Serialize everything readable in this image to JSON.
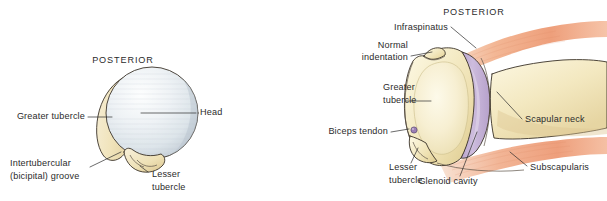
{
  "figure": {
    "background_color": "#ffffff",
    "text_color": "#2b2b2b",
    "panels": [
      {
        "id": "left-panel",
        "name": "humeral-head-posterior-view",
        "orientation_label": "POSTERIOR",
        "colors": {
          "head": "#e8ecef",
          "head_shadow": "#c8d2da",
          "bone": "#f0e5c4",
          "bone_shadow": "#ddcb9b",
          "outline": "#3a3228"
        },
        "labels": [
          {
            "id": "posterior",
            "name": "label-posterior-left",
            "text": "POSTERIOR",
            "lines": [
              "POSTERIOR"
            ],
            "style": "caps"
          },
          {
            "id": "greater-tubercle",
            "name": "label-greater-tubercle-left",
            "text": "Greater tubercle",
            "lines": [
              "Greater tubercle"
            ],
            "style": "normal"
          },
          {
            "id": "head",
            "name": "label-head",
            "text": "Head",
            "lines": [
              "Head"
            ],
            "style": "normal"
          },
          {
            "id": "intertubercular-groove",
            "name": "label-intertubercular-groove",
            "text": "Intertubercular (bicipital) groove",
            "lines": [
              "Intertubercular",
              "(bicipital) groove"
            ],
            "style": "normal"
          },
          {
            "id": "lesser-tubercle",
            "name": "label-lesser-tubercle-left",
            "text": "Lesser tubercle",
            "lines": [
              "Lesser",
              "tubercle"
            ],
            "style": "normal"
          }
        ]
      },
      {
        "id": "right-panel",
        "name": "glenohumeral-joint-cross-section",
        "orientation_label": "POSTERIOR",
        "colors": {
          "bone": "#f3e9c2",
          "bone_light": "#faf3d8",
          "bone_shadow": "#e0d096",
          "cartilage": "#c3b1d4",
          "cartilage_light": "#d8cce4",
          "muscle": "#f0a583",
          "muscle_light": "#f9d9c6",
          "outline": "#3a3228"
        },
        "labels": [
          {
            "id": "posterior",
            "name": "label-posterior-right",
            "text": "POSTERIOR",
            "lines": [
              "POSTERIOR"
            ],
            "style": "caps"
          },
          {
            "id": "infraspinatus",
            "name": "label-infraspinatus",
            "text": "Infraspinatus",
            "lines": [
              "Infraspinatus"
            ],
            "style": "normal"
          },
          {
            "id": "normal-indentation",
            "name": "label-normal-indentation",
            "text": "Normal indentation",
            "lines": [
              "Normal",
              "indentation"
            ],
            "style": "normal"
          },
          {
            "id": "greater-tubercle",
            "name": "label-greater-tubercle-right",
            "text": "Greater tubercle",
            "lines": [
              "Greater",
              "tubercle"
            ],
            "style": "normal"
          },
          {
            "id": "biceps-tendon",
            "name": "label-biceps-tendon",
            "text": "Biceps tendon",
            "lines": [
              "Biceps tendon"
            ],
            "style": "normal"
          },
          {
            "id": "lesser-tubercle",
            "name": "label-lesser-tubercle-right",
            "text": "Lesser tubercle",
            "lines": [
              "Lesser",
              "tubercle"
            ],
            "style": "normal"
          },
          {
            "id": "glenoid-cavity",
            "name": "label-glenoid-cavity",
            "text": "Glenoid cavity",
            "lines": [
              "Glenoid cavity"
            ],
            "style": "normal"
          },
          {
            "id": "scapular-neck",
            "name": "label-scapular-neck",
            "text": "Scapular neck",
            "lines": [
              "Scapular neck"
            ],
            "style": "normal"
          },
          {
            "id": "subscapularis",
            "name": "label-subscapularis",
            "text": "Subscapularis",
            "lines": [
              "Subscapularis"
            ],
            "style": "normal"
          }
        ]
      }
    ]
  },
  "text": {
    "posterior_left": "POSTERIOR",
    "greater_tubercle_left": "Greater tubercle",
    "head": "Head",
    "intertubercular_l1": "Intertubercular",
    "intertubercular_l2": "(bicipital) groove",
    "lesser_tubercle_left_l1": "Lesser",
    "lesser_tubercle_left_l2": "tubercle",
    "posterior_right": "POSTERIOR",
    "infraspinatus": "Infraspinatus",
    "normal_indentation_l1": "Normal",
    "normal_indentation_l2": "indentation",
    "greater_tubercle_right_l1": "Greater",
    "greater_tubercle_right_l2": "tubercle",
    "biceps_tendon": "Biceps tendon",
    "lesser_tubercle_right_l1": "Lesser",
    "lesser_tubercle_right_l2": "tubercle",
    "glenoid_cavity": "Glenoid cavity",
    "scapular_neck": "Scapular neck",
    "subscapularis": "Subscapularis"
  }
}
